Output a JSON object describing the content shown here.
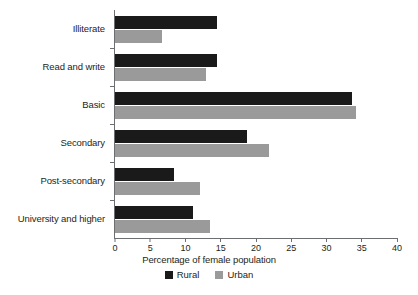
{
  "chart_data": {
    "type": "bar",
    "orientation": "horizontal",
    "title": "",
    "xlabel": "Percentage of female population",
    "ylabel": "",
    "xlim": [
      0,
      40
    ],
    "xticks": [
      0,
      5,
      10,
      15,
      20,
      25,
      30,
      35,
      40
    ],
    "grid": false,
    "legend_position": "bottom",
    "categories": [
      "Illiterate",
      "Read and write",
      "Basic",
      "Secondary",
      "Post-secondary",
      "University and higher"
    ],
    "series": [
      {
        "name": "Rural",
        "color": "#1a1a1a",
        "values": [
          14.5,
          14.5,
          33.6,
          18.7,
          8.4,
          11.1
        ]
      },
      {
        "name": "Urban",
        "color": "#9a9a9a",
        "values": [
          6.7,
          12.9,
          34.2,
          21.8,
          12.1,
          13.4
        ]
      }
    ]
  },
  "legend": {
    "items": [
      {
        "label": "Rural",
        "swatch": "rural"
      },
      {
        "label": "Urban",
        "swatch": "urban"
      }
    ]
  },
  "colors": {
    "rural": "#1a1a1a",
    "urban": "#9a9a9a",
    "axis": "#6d6e71",
    "text": "#231f20",
    "background": "#ffffff"
  }
}
